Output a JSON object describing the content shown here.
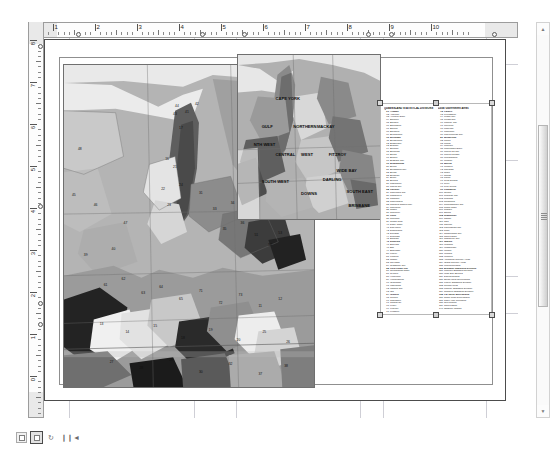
{
  "app": {
    "view_mode": "layout-view",
    "background_color": "#ffffff",
    "page_border_color": "#4c4c4c",
    "guide_color": "#cfcfd6",
    "selection_handle_color": "#4a4a4a"
  },
  "rulers": {
    "units": "inches",
    "horizontal": {
      "labels": [
        "1",
        "2",
        "3",
        "4",
        "5",
        "6",
        "7",
        "8",
        "9",
        "10"
      ],
      "origin_px": 24,
      "spacing_px": 42,
      "guide_positions": [
        "0.6",
        "3.55",
        "4.55",
        "7.5",
        "8.05",
        "10.5"
      ]
    },
    "vertical": {
      "labels": [
        "8",
        "7",
        "6",
        "5",
        "4",
        "3",
        "2",
        "1",
        "0"
      ],
      "origin_px": 18,
      "spacing_px": 42,
      "guide_positions": [
        "7.85",
        "4.05",
        "1.75",
        "1.25"
      ]
    }
  },
  "map_main": {
    "title": "queensland-regions-main-map",
    "frame_label": "main data frame",
    "fill_palette": [
      "#d8d8d8",
      "#c2c2c2",
      "#ababab",
      "#949494",
      "#7d7d7d",
      "#666666",
      "#4f4f4f",
      "#383838",
      "#222222",
      "#efefef"
    ],
    "ocean_color": "#e9e9e9",
    "labels": [
      "44",
      "42",
      "43",
      "41",
      "17",
      "16",
      "21",
      "22",
      "24",
      "23",
      "31",
      "33",
      "34",
      "35",
      "36",
      "51",
      "52",
      "53",
      "61",
      "62",
      "63",
      "64",
      "65",
      "71",
      "72",
      "73",
      "11",
      "12",
      "13",
      "14",
      "15"
    ]
  },
  "map_inset": {
    "title": "queensland-overview-inset-map",
    "frame_label": "inset data frame",
    "fill_palette": [
      "#b0b0b0",
      "#9a9a9a",
      "#868686",
      "#747474",
      "#5f5f5f",
      "#d0d0d0",
      "#e4e4e4"
    ],
    "ocean_color": "#e7e7e7",
    "labels": [
      "CAPE YORK",
      "GULF",
      "NORTH WEST",
      "NORTHERN",
      "MACKAY",
      "CENTRAL WEST",
      "FITZROY",
      "WIDE BAY",
      "SOUTH WEST",
      "DARLING DOWNS",
      "SOUTH EAST",
      "BRISBANE"
    ]
  },
  "legend": {
    "selected": true,
    "columns": [
      {
        "title": "QUEENSLAND STATISTICAL DIVISIONS",
        "rows": [
          {
            "num": "01",
            "label": "Aramac"
          },
          {
            "num": "02",
            "label": "Atherton"
          },
          {
            "num": "03",
            "label": "Aurukun Shire"
          },
          {
            "num": "04",
            "label": "Balonne"
          },
          {
            "num": "05",
            "label": "Banana"
          },
          {
            "num": "06",
            "label": "Barcaldine"
          },
          {
            "num": "07",
            "label": "Barcoo"
          },
          {
            "num": "08",
            "label": "Bauhinia"
          },
          {
            "num": "09",
            "label": "Beaudesert"
          },
          {
            "num": "10",
            "label": "Belyando"
          },
          {
            "num": "11",
            "label": "Bendemere"
          },
          {
            "num": "12",
            "label": "Biggenden"
          },
          {
            "num": "13",
            "label": "Blackall"
          },
          {
            "num": "14",
            "label": "Boonah"
          },
          {
            "num": "15",
            "label": "Booringa"
          },
          {
            "num": "16",
            "label": "Boulia"
          },
          {
            "num": "17",
            "label": "Bowen"
          },
          {
            "num": "18",
            "label": "Brisbane City"
          },
          {
            "num": "19",
            "label": "Broadsound"
          },
          {
            "num": "20",
            "label": "Bulloo"
          },
          {
            "num": "21",
            "label": "Bundaberg City"
          },
          {
            "num": "22",
            "label": "Bungil"
          },
          {
            "num": "23",
            "label": "Burdekin"
          },
          {
            "num": "24",
            "label": "Burke"
          },
          {
            "num": "25",
            "label": "Burnett"
          },
          {
            "num": "26",
            "label": "Caboolture"
          },
          {
            "num": "27",
            "label": "Cairns City"
          },
          {
            "num": "28",
            "label": "Calliope"
          },
          {
            "num": "29",
            "label": "Caloundra City"
          },
          {
            "num": "30",
            "label": "Cambooya"
          },
          {
            "num": "31",
            "label": "Cardwell"
          },
          {
            "num": "32",
            "label": "Carpentaria"
          },
          {
            "num": "33",
            "label": "Charters Towers City"
          },
          {
            "num": "34",
            "label": "Chinchilla"
          },
          {
            "num": "35",
            "label": "Clifton"
          },
          {
            "num": "36",
            "label": "Cloncurry"
          },
          {
            "num": "37",
            "label": "Cook"
          },
          {
            "num": "38",
            "label": "Cooloola"
          },
          {
            "num": "39",
            "label": "Crows Nest"
          },
          {
            "num": "40",
            "label": "Dalby Town"
          },
          {
            "num": "41",
            "label": "Dalrymple"
          },
          {
            "num": "42",
            "label": "Diamantina"
          },
          {
            "num": "43",
            "label": "Douglas"
          },
          {
            "num": "44",
            "label": "Duaringa"
          },
          {
            "num": "45",
            "label": "Eacham"
          },
          {
            "num": "46",
            "label": "Eidsvold"
          },
          {
            "num": "47",
            "label": "Emerald"
          },
          {
            "num": "48",
            "label": "Esk"
          },
          {
            "num": "49",
            "label": "Etheridge"
          },
          {
            "num": "50",
            "label": "Fitzroy"
          },
          {
            "num": "51",
            "label": "Flinders"
          },
          {
            "num": "52",
            "label": "Gatton"
          },
          {
            "num": "53",
            "label": "Gayndah"
          },
          {
            "num": "54",
            "label": "Gladstone City"
          },
          {
            "num": "55",
            "label": "Gold Coast City"
          },
          {
            "num": "56",
            "label": "Goondiwindi Town"
          },
          {
            "num": "57",
            "label": "Gympie"
          },
          {
            "num": "58",
            "label": "Herberton"
          },
          {
            "num": "59",
            "label": "Hinchinbrook"
          },
          {
            "num": "60",
            "label": "Ilfracombe"
          },
          {
            "num": "61",
            "label": "Inglewood"
          },
          {
            "num": "62",
            "label": "Ipswich City"
          },
          {
            "num": "63",
            "label": "Isis"
          },
          {
            "num": "64",
            "label": "Isisford"
          },
          {
            "num": "65",
            "label": "Jericho"
          },
          {
            "num": "66",
            "label": "Johnstone"
          },
          {
            "num": "67",
            "label": "Jondaryan"
          },
          {
            "num": "68",
            "label": "Kilcoy"
          },
          {
            "num": "69",
            "label": "Kilkivan"
          },
          {
            "num": "70",
            "label": "Kingaroy"
          },
          {
            "num": "71",
            "label": "Kolan"
          }
        ]
      },
      {
        "title": "Local Government Areas",
        "rows": [
          {
            "num": "72",
            "label": "Laidley"
          },
          {
            "num": "73",
            "label": "Livingstone"
          },
          {
            "num": "74",
            "label": "Logan City"
          },
          {
            "num": "75",
            "label": "Longreach"
          },
          {
            "num": "76",
            "label": "Mackay City"
          },
          {
            "num": "77",
            "label": "McKinlay"
          },
          {
            "num": "78",
            "label": "Mareeba"
          },
          {
            "num": "79",
            "label": "Maroochy"
          },
          {
            "num": "80",
            "label": "Maryborough City"
          },
          {
            "num": "81",
            "label": "Millmerran"
          },
          {
            "num": "82",
            "label": "Mirani"
          },
          {
            "num": "83",
            "label": "Monto"
          },
          {
            "num": "84",
            "label": "Moreton"
          },
          {
            "num": "85",
            "label": "Mornington Shire"
          },
          {
            "num": "86",
            "label": "Mount Isa City"
          },
          {
            "num": "87",
            "label": "Mount Morgan"
          },
          {
            "num": "88",
            "label": "Mundubbera"
          },
          {
            "num": "89",
            "label": "Murgon"
          },
          {
            "num": "90",
            "label": "Murilla"
          },
          {
            "num": "91",
            "label": "Murweh"
          },
          {
            "num": "92",
            "label": "Nanango"
          },
          {
            "num": "93",
            "label": "Nebo"
          },
          {
            "num": "94",
            "label": "Noosa"
          },
          {
            "num": "95",
            "label": "Paroo"
          },
          {
            "num": "96",
            "label": "Peak Downs"
          },
          {
            "num": "97",
            "label": "Perry"
          },
          {
            "num": "98",
            "label": "Pine Rivers"
          },
          {
            "num": "99",
            "label": "Pittsworth"
          },
          {
            "num": "100",
            "label": "Quilpie"
          },
          {
            "num": "101",
            "label": "Redcliffe City"
          },
          {
            "num": "102",
            "label": "Redland"
          },
          {
            "num": "103",
            "label": "Richmond"
          },
          {
            "num": "104",
            "label": "Rockhampton City"
          },
          {
            "num": "105",
            "label": "Roma Town"
          },
          {
            "num": "106",
            "label": "Rosalie"
          },
          {
            "num": "107",
            "label": "Sarina"
          },
          {
            "num": "108",
            "label": "Stanthorpe"
          },
          {
            "num": "109",
            "label": "Tambo"
          },
          {
            "num": "110",
            "label": "Tara"
          },
          {
            "num": "111",
            "label": "Taroom"
          },
          {
            "num": "112",
            "label": "Thuringowa City"
          },
          {
            "num": "113",
            "label": "Tiaro"
          },
          {
            "num": "114",
            "label": "Toowoomba City"
          },
          {
            "num": "115",
            "label": "Torres Shire"
          },
          {
            "num": "116",
            "label": "Townsville City"
          },
          {
            "num": "117",
            "label": "Warroo"
          },
          {
            "num": "118",
            "label": "Warwick"
          },
          {
            "num": "119",
            "label": "Whitsunday"
          },
          {
            "num": "120",
            "label": "Winton"
          },
          {
            "num": "121",
            "label": "Wondai"
          },
          {
            "num": "122",
            "label": "Woocoo"
          },
          {
            "num": "123",
            "label": "Aboriginal Council Areas"
          },
          {
            "num": "124",
            "label": "Island Council Areas"
          },
          {
            "num": "125",
            "label": "Unincorporated"
          },
          {
            "num": "126",
            "label": "Brisbane Statistical Division"
          },
          {
            "num": "127",
            "label": "Moreton Statistical Division"
          },
          {
            "num": "128",
            "label": "Wide Bay-Burnett"
          },
          {
            "num": "129",
            "label": "Darling Downs"
          },
          {
            "num": "130",
            "label": "South West Queensland"
          },
          {
            "num": "131",
            "label": "Fitzroy Statistical Division"
          },
          {
            "num": "132",
            "label": "Central West"
          },
          {
            "num": "133",
            "label": "Mackay Statistical Division"
          },
          {
            "num": "134",
            "label": "Northern Statistical Division"
          },
          {
            "num": "135",
            "label": "Far North Queensland"
          },
          {
            "num": "136",
            "label": "North West Queensland"
          },
          {
            "num": "137",
            "label": "Cape York Peninsula"
          },
          {
            "num": "138",
            "label": "Gulf Region"
          },
          {
            "num": "139",
            "label": "Torres Strait"
          },
          {
            "num": "140",
            "label": "Offshore Islands"
          }
        ]
      }
    ]
  },
  "scrollbars": {
    "vertical": {
      "up_arrow": "▲",
      "down_arrow": "▼",
      "thumb_top_pct": 26,
      "thumb_height_pct": 46
    },
    "horizontal": {
      "left_arrow": "◄",
      "right_arrow": "►",
      "thumb_left_pct": 30,
      "thumb_width_pct": 46
    }
  },
  "statusbar": {
    "buttons": [
      {
        "name": "data-view-button",
        "glyph": "▣",
        "active": false
      },
      {
        "name": "layout-view-button",
        "glyph": "▤",
        "active": true
      },
      {
        "name": "refresh-button",
        "glyph": "↻",
        "active": false
      },
      {
        "name": "pause-button",
        "glyph": "❙❙",
        "active": false
      },
      {
        "name": "previous-button",
        "glyph": "◄",
        "active": false
      }
    ]
  }
}
